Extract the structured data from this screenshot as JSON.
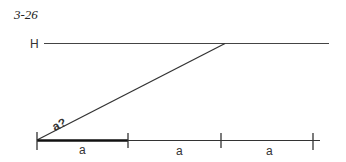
{
  "figure": {
    "label": "3-26",
    "h_label": "H",
    "diagonal_label": "a?",
    "segment_labels": [
      "a",
      "a",
      "a"
    ]
  },
  "colors": {
    "line": "#333333",
    "bold_segment": "#111111"
  }
}
